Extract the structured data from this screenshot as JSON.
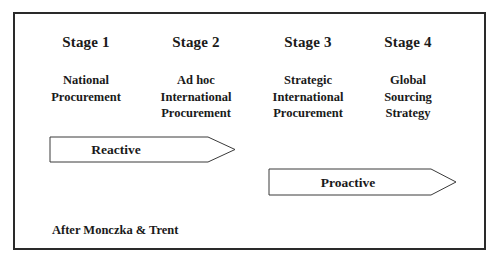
{
  "diagram": {
    "stages": [
      {
        "title": "Stage 1",
        "description": [
          "National",
          "Procurement"
        ]
      },
      {
        "title": "Stage 2",
        "description": [
          "Ad hoc",
          "International",
          "Procurement"
        ]
      },
      {
        "title": "Stage 3",
        "description": [
          "Strategic",
          "International",
          "Procurement"
        ]
      },
      {
        "title": "Stage 4",
        "description": [
          "Global",
          "Sourcing",
          "Strategy"
        ]
      }
    ],
    "arrows": [
      {
        "label": "Reactive",
        "spans_stages": [
          "Stage 1",
          "Stage 2"
        ]
      },
      {
        "label": "Proactive",
        "spans_stages": [
          "Stage 3",
          "Stage 4"
        ]
      }
    ],
    "footnote": "After Monczka & Trent"
  }
}
